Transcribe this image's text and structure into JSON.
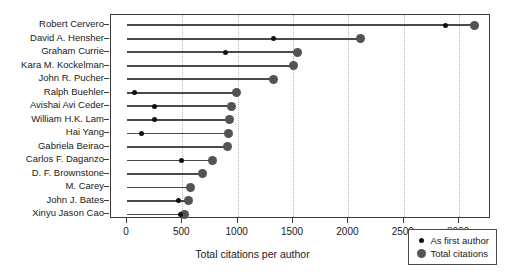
{
  "chart_data": {
    "type": "scatter",
    "subtype": "lollipop-dumbbell-horizontal",
    "title": "",
    "xlabel": "Total citations per author",
    "ylabel": "",
    "xlim": [
      0,
      3300
    ],
    "ylim_categories": 15,
    "grid": "vertical-dotted",
    "legend_position": "bottom-right",
    "xticks": [
      0,
      500,
      1000,
      1500,
      2000,
      2500,
      3000
    ],
    "xticklabels": [
      "0",
      "500",
      "1000",
      "1500",
      "2000",
      "2500",
      "3000"
    ],
    "categories": [
      "Robert Cervero",
      "David A. Hensher",
      "Graham Currie",
      "Kara M. Kockelman",
      "John R. Pucher",
      "Ralph Buehler",
      "Avishai Avi Ceder",
      "William H.K. Lam",
      "Hai Yang",
      "Gabriela Beirao",
      "Carlos F. Daganzo",
      "D. F. Brownstone",
      "M. Carey",
      "John J. Bates",
      "Xinyu Jason Cao"
    ],
    "series": [
      {
        "name": "As first author",
        "marker": "small-black-dot",
        "color": "#111111",
        "values": [
          2880,
          1320,
          890,
          null,
          null,
          70,
          250,
          250,
          130,
          null,
          490,
          null,
          null,
          465,
          480
        ]
      },
      {
        "name": "Total citations",
        "marker": "large-gray-dot",
        "color": "#545454",
        "values": [
          3135,
          2110,
          1540,
          1500,
          1320,
          990,
          940,
          930,
          920,
          905,
          775,
          680,
          570,
          555,
          520
        ]
      }
    ]
  },
  "legend": {
    "entries": [
      {
        "label": "As first author",
        "swatch": "small-black-dot"
      },
      {
        "label": "Total citations",
        "swatch": "large-gray-dot"
      }
    ]
  },
  "axis": {
    "x_title": "Total citations per author"
  }
}
